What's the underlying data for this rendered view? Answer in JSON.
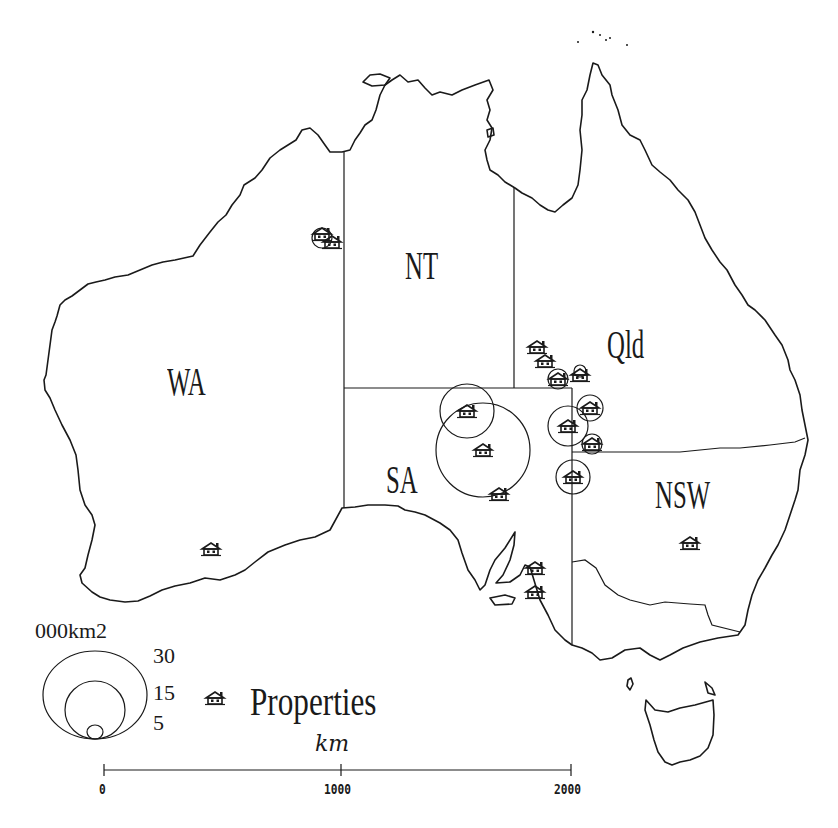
{
  "map": {
    "title": "Properties map of Australia",
    "states": [
      {
        "id": "WA",
        "label": "WA",
        "x": 167,
        "y": 362
      },
      {
        "id": "NT",
        "label": "NT",
        "x": 405,
        "y": 246
      },
      {
        "id": "Qld",
        "label": "Qld",
        "x": 607,
        "y": 325
      },
      {
        "id": "SA",
        "label": "SA",
        "x": 386,
        "y": 460
      },
      {
        "id": "NSW",
        "label": "NSW",
        "x": 655,
        "y": 475
      }
    ],
    "properties": [
      {
        "x": 322,
        "y": 234,
        "circle_r": 10
      },
      {
        "x": 332,
        "y": 242,
        "circle_r": 0
      },
      {
        "x": 537,
        "y": 347,
        "circle_r": 0
      },
      {
        "x": 545,
        "y": 361,
        "circle_r": 0
      },
      {
        "x": 558,
        "y": 379,
        "circle_r": 10
      },
      {
        "x": 580,
        "y": 373,
        "circle_r": 6
      },
      {
        "x": 467,
        "y": 411,
        "circle_r": 27
      },
      {
        "x": 483,
        "y": 450,
        "circle_r": 47
      },
      {
        "x": 499,
        "y": 494,
        "circle_r": 0
      },
      {
        "x": 568,
        "y": 426,
        "circle_r": 20
      },
      {
        "x": 590,
        "y": 408,
        "circle_r": 13
      },
      {
        "x": 592,
        "y": 444,
        "circle_r": 10
      },
      {
        "x": 573,
        "y": 477,
        "circle_r": 17
      },
      {
        "x": 690,
        "y": 543,
        "circle_r": 0
      },
      {
        "x": 211,
        "y": 549,
        "circle_r": 0
      },
      {
        "x": 535,
        "y": 568,
        "circle_r": 0
      },
      {
        "x": 535,
        "y": 592,
        "circle_r": 0
      }
    ]
  },
  "legend": {
    "area_title": "000km2",
    "area_values": [
      "30",
      "15",
      "5"
    ],
    "property_label": "Properties",
    "property_icon": "house-icon"
  },
  "scale_bar": {
    "unit": "km",
    "ticks": [
      "0",
      "1000",
      "2000"
    ]
  }
}
